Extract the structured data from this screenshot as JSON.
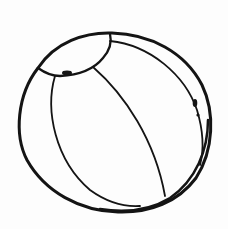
{
  "image": {
    "subject": "beach ball line drawing",
    "background_color": "#fdfdfd",
    "stroke_color": "#141414"
  },
  "elements": {
    "outer_outline": "beach ball outline",
    "top_cap": "top cap panel",
    "left_seam": "left panel seam",
    "middle_seam": "middle panel seam",
    "right_seam": "right panel seam",
    "valve": "air valve"
  }
}
